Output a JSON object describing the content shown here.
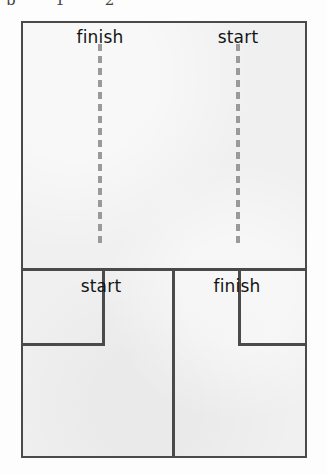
{
  "page": {
    "clipped_header_text": "p                   1   2"
  },
  "figure": {
    "name": "maze-route-comparison",
    "frame": {
      "x": 21,
      "y": 21,
      "width": 286,
      "height": 437,
      "fill_color": "#f0f0f0",
      "border_color": "#4a4a4a",
      "border_width": 2
    },
    "upper_panel": {
      "name": "upper-maze-panel",
      "labels": [
        {
          "id": "upper-finish",
          "text": "finish",
          "x": 100,
          "y": 36
        },
        {
          "id": "upper-start",
          "text": "start",
          "x": 238,
          "y": 36
        }
      ],
      "dashed_lines": [
        {
          "id": "dashed-path-finish",
          "x": 100,
          "y_top": 44,
          "y_bottom": 247,
          "color": "#9a9a9a",
          "width": 4,
          "dash": 7,
          "gap": 5
        },
        {
          "id": "dashed-path-start",
          "x": 238,
          "y_top": 44,
          "y_bottom": 247,
          "color": "#9a9a9a",
          "width": 4,
          "dash": 7,
          "gap": 5
        }
      ]
    },
    "divider": {
      "id": "horizontal-divider",
      "y": 268,
      "x_start": 21,
      "x_end": 307,
      "color": "#4a4a4a",
      "thickness": 3
    },
    "lower_panel": {
      "name": "lower-maze-panel",
      "labels": [
        {
          "id": "lower-start",
          "text": "start",
          "x": 101,
          "y": 290
        },
        {
          "id": "lower-finish",
          "text": "finish",
          "x": 237,
          "y": 290
        }
      ],
      "walls": [
        {
          "id": "center-divider-wall",
          "orientation": "vertical",
          "x": 172,
          "y_start": 268,
          "y_end": 456
        },
        {
          "id": "left-wall-vertical",
          "orientation": "vertical",
          "x": 102,
          "y_start": 268,
          "y_end": 345
        },
        {
          "id": "left-wall-horizontal",
          "orientation": "horizontal",
          "y": 343,
          "x_start": 21,
          "x_end": 104
        },
        {
          "id": "right-wall-vertical",
          "orientation": "vertical",
          "x": 238,
          "y_start": 268,
          "y_end": 345
        },
        {
          "id": "right-wall-horizontal",
          "orientation": "horizontal",
          "y": 343,
          "x_start": 238,
          "x_end": 307
        }
      ]
    },
    "colors": {
      "wall": "#4a4a4a",
      "dashed_path": "#9a9a9a",
      "panel_fill": "#f0f0f0",
      "label_text": "#141414",
      "page_background": "#fdfdfd"
    }
  }
}
